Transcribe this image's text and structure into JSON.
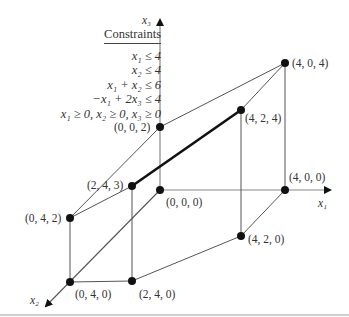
{
  "constraints": {
    "title": "Constraints",
    "rows": [
      "x₁ ≤ 4",
      "x₂ ≤ 4",
      "x₁ + x₂ ≤ 6",
      "−x₁ + 2x₃ ≤ 4",
      "x₁ ≥ 0,  x₂ ≥ 0,  x₃ ≥ 0"
    ]
  },
  "axes": {
    "x1": "x₁",
    "x2": "x₂",
    "x3": "x₃"
  },
  "vertices": [
    {
      "label": "(0, 0, 0)",
      "px": [
        160,
        190
      ]
    },
    {
      "label": "(0, 0, 2)",
      "px": [
        160,
        127
      ]
    },
    {
      "label": "(4, 0, 4)",
      "px": [
        285,
        63
      ]
    },
    {
      "label": "(4, 2, 4)",
      "px": [
        241,
        110
      ]
    },
    {
      "label": "(2, 4, 3)",
      "px": [
        132,
        186
      ]
    },
    {
      "label": "(0, 4, 2)",
      "px": [
        70,
        218
      ]
    },
    {
      "label": "(0, 4, 0)",
      "px": [
        70,
        282
      ]
    },
    {
      "label": "(2, 4, 0)",
      "px": [
        132,
        281
      ]
    },
    {
      "label": "(4, 2, 0)",
      "px": [
        241,
        236
      ]
    },
    {
      "label": "(4, 0, 0)",
      "px": [
        285,
        190
      ]
    }
  ],
  "highlighted_edge": [
    "(2, 4, 3)",
    "(4, 2, 4)"
  ]
}
